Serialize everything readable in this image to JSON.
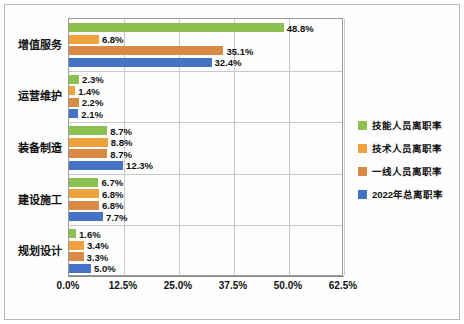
{
  "chart_data": {
    "type": "bar",
    "orientation": "horizontal",
    "title": "",
    "xlabel": "",
    "ylabel": "",
    "categories": [
      "增值服务",
      "运营维护",
      "装备制造",
      "建设施工",
      "规划设计"
    ],
    "xlim": [
      0,
      62.5
    ],
    "xticks": [
      "0.0%",
      "12.5%",
      "25.0%",
      "37.5%",
      "50.0%",
      "62.5%"
    ],
    "xtick_values": [
      0,
      12.5,
      25,
      37.5,
      50,
      62.5
    ],
    "grid": true,
    "legend_position": "right",
    "series": [
      {
        "name": "技能人员离职率",
        "color": "#8cc152",
        "values": [
          48.8,
          2.3,
          8.7,
          6.7,
          1.6
        ],
        "labels": [
          "48.8%",
          "2.3%",
          "8.7%",
          "6.7%",
          "1.6%"
        ]
      },
      {
        "name": "技术人员离职率",
        "color": "#f0a23c",
        "values": [
          6.8,
          1.4,
          8.8,
          6.8,
          3.4
        ],
        "labels": [
          "6.8%",
          "1.4%",
          "8.8%",
          "6.8%",
          "3.4%"
        ]
      },
      {
        "name": "一线人员离职率",
        "color": "#d98b45",
        "values": [
          35.1,
          2.2,
          8.7,
          6.8,
          3.3
        ],
        "labels": [
          "35.1%",
          "2.2%",
          "8.7%",
          "6.8%",
          "3.3%"
        ]
      },
      {
        "name": "2022年总离职率",
        "color": "#4472c4",
        "values": [
          32.4,
          2.1,
          12.3,
          7.7,
          5.0
        ],
        "labels": [
          "32.4%",
          "2.1%",
          "12.3%",
          "7.7%",
          "5.0%"
        ]
      }
    ]
  }
}
